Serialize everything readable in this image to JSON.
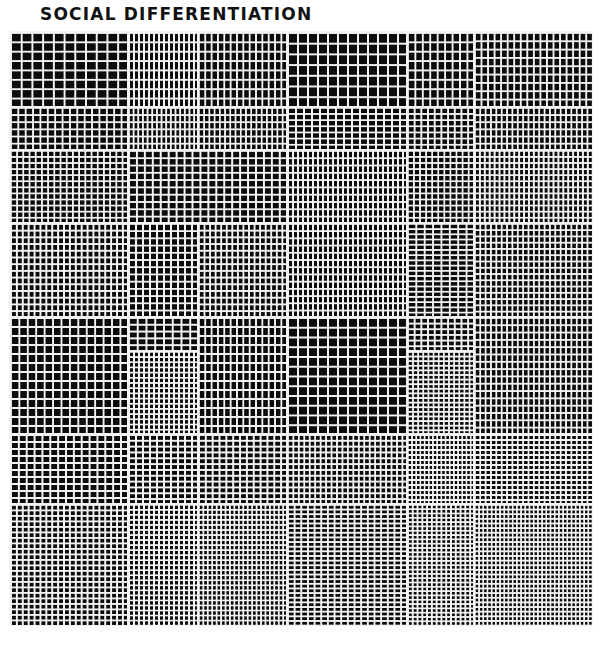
{
  "title": "SOCIAL DIFFERENTIATION",
  "artwork": {
    "origin": [
      10,
      32
    ],
    "size": [
      582,
      593
    ],
    "ink_color": "#0c0c0c",
    "paper_color": "#f4f4f4",
    "line_width": 1.6,
    "blocks": [
      {
        "x": 0,
        "y": 0,
        "w": 118,
        "h": 75,
        "nx": 11,
        "ny": 8
      },
      {
        "x": 118,
        "y": 0,
        "w": 70,
        "h": 75,
        "nx": 14,
        "ny": 8
      },
      {
        "x": 188,
        "y": 0,
        "w": 89,
        "h": 75,
        "nx": 14,
        "ny": 8
      },
      {
        "x": 277,
        "y": 0,
        "w": 120,
        "h": 75,
        "nx": 12,
        "ny": 7
      },
      {
        "x": 397,
        "y": 0,
        "w": 67,
        "h": 75,
        "nx": 9,
        "ny": 8
      },
      {
        "x": 464,
        "y": 0,
        "w": 118,
        "h": 75,
        "nx": 18,
        "ny": 9
      },
      {
        "x": 0,
        "y": 75,
        "w": 118,
        "h": 43,
        "nx": 16,
        "ny": 6
      },
      {
        "x": 118,
        "y": 75,
        "w": 70,
        "h": 43,
        "nx": 15,
        "ny": 6
      },
      {
        "x": 188,
        "y": 75,
        "w": 89,
        "h": 43,
        "nx": 17,
        "ny": 6
      },
      {
        "x": 277,
        "y": 75,
        "w": 120,
        "h": 43,
        "nx": 15,
        "ny": 7
      },
      {
        "x": 397,
        "y": 75,
        "w": 67,
        "h": 43,
        "nx": 10,
        "ny": 7
      },
      {
        "x": 464,
        "y": 75,
        "w": 118,
        "h": 43,
        "nx": 22,
        "ny": 6
      },
      {
        "x": 0,
        "y": 118,
        "w": 118,
        "h": 73,
        "nx": 19,
        "ny": 12
      },
      {
        "x": 118,
        "y": 118,
        "w": 159,
        "h": 73,
        "nx": 20,
        "ny": 10
      },
      {
        "x": 277,
        "y": 118,
        "w": 120,
        "h": 73,
        "nx": 24,
        "ny": 10
      },
      {
        "x": 397,
        "y": 118,
        "w": 67,
        "h": 73,
        "nx": 11,
        "ny": 12
      },
      {
        "x": 464,
        "y": 118,
        "w": 118,
        "h": 73,
        "nx": 24,
        "ny": 12
      },
      {
        "x": 0,
        "y": 191,
        "w": 118,
        "h": 94,
        "nx": 20,
        "ny": 14
      },
      {
        "x": 118,
        "y": 191,
        "w": 70,
        "h": 94,
        "nx": 10,
        "ny": 13
      },
      {
        "x": 188,
        "y": 191,
        "w": 89,
        "h": 94,
        "nx": 16,
        "ny": 14
      },
      {
        "x": 277,
        "y": 191,
        "w": 120,
        "h": 94,
        "nx": 24,
        "ny": 13
      },
      {
        "x": 397,
        "y": 191,
        "w": 67,
        "h": 94,
        "nx": 8,
        "ny": 18
      },
      {
        "x": 464,
        "y": 191,
        "w": 118,
        "h": 94,
        "nx": 22,
        "ny": 15
      },
      {
        "x": 0,
        "y": 285,
        "w": 118,
        "h": 117,
        "nx": 14,
        "ny": 13
      },
      {
        "x": 118,
        "y": 285,
        "w": 70,
        "h": 34,
        "nx": 8,
        "ny": 5
      },
      {
        "x": 118,
        "y": 319,
        "w": 70,
        "h": 83,
        "nx": 14,
        "ny": 16
      },
      {
        "x": 188,
        "y": 285,
        "w": 89,
        "h": 117,
        "nx": 14,
        "ny": 13
      },
      {
        "x": 277,
        "y": 285,
        "w": 120,
        "h": 117,
        "nx": 12,
        "ny": 12
      },
      {
        "x": 397,
        "y": 285,
        "w": 67,
        "h": 34,
        "nx": 10,
        "ny": 6
      },
      {
        "x": 397,
        "y": 319,
        "w": 67,
        "h": 83,
        "nx": 13,
        "ny": 18
      },
      {
        "x": 464,
        "y": 285,
        "w": 118,
        "h": 117,
        "nx": 22,
        "ny": 16
      },
      {
        "x": 0,
        "y": 402,
        "w": 118,
        "h": 70,
        "nx": 15,
        "ny": 10
      },
      {
        "x": 118,
        "y": 402,
        "w": 70,
        "h": 70,
        "nx": 10,
        "ny": 12
      },
      {
        "x": 188,
        "y": 402,
        "w": 89,
        "h": 70,
        "nx": 13,
        "ny": 12
      },
      {
        "x": 277,
        "y": 402,
        "w": 120,
        "h": 70,
        "nx": 22,
        "ny": 12
      },
      {
        "x": 397,
        "y": 402,
        "w": 67,
        "h": 70,
        "nx": 16,
        "ny": 14
      },
      {
        "x": 464,
        "y": 402,
        "w": 118,
        "h": 70,
        "nx": 22,
        "ny": 14
      },
      {
        "x": 0,
        "y": 472,
        "w": 118,
        "h": 121,
        "nx": 20,
        "ny": 22
      },
      {
        "x": 118,
        "y": 472,
        "w": 70,
        "h": 121,
        "nx": 14,
        "ny": 24
      },
      {
        "x": 188,
        "y": 472,
        "w": 89,
        "h": 121,
        "nx": 20,
        "ny": 24
      },
      {
        "x": 277,
        "y": 472,
        "w": 120,
        "h": 121,
        "nx": 18,
        "ny": 26
      },
      {
        "x": 397,
        "y": 472,
        "w": 67,
        "h": 121,
        "nx": 14,
        "ny": 28
      },
      {
        "x": 464,
        "y": 472,
        "w": 118,
        "h": 121,
        "nx": 28,
        "ny": 26
      }
    ]
  }
}
